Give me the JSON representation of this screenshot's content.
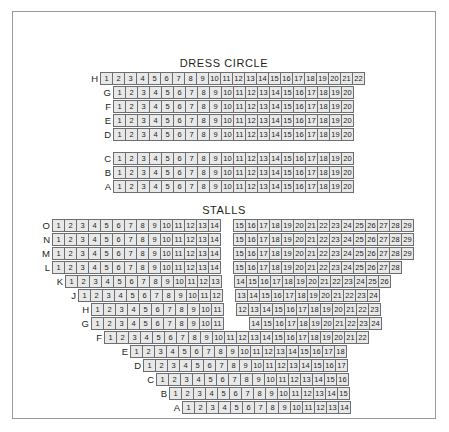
{
  "plan": {
    "sections": [
      {
        "name": "dress-circle",
        "title": "DRESS CIRCLE",
        "groups": [
          {
            "rows": [
              {
                "label": "H",
                "indent": 0,
                "blocks": [
                  {
                    "from": 1,
                    "to": 22
                  }
                ]
              },
              {
                "label": "G",
                "indent": 13,
                "blocks": [
                  {
                    "from": 1,
                    "to": 20
                  }
                ]
              },
              {
                "label": "F",
                "indent": 13,
                "blocks": [
                  {
                    "from": 1,
                    "to": 20
                  }
                ]
              },
              {
                "label": "E",
                "indent": 13,
                "blocks": [
                  {
                    "from": 1,
                    "to": 20
                  }
                ]
              },
              {
                "label": "D",
                "indent": 13,
                "blocks": [
                  {
                    "from": 1,
                    "to": 20
                  }
                ]
              }
            ]
          },
          {
            "rows": [
              {
                "label": "C",
                "indent": 13,
                "blocks": [
                  {
                    "from": 1,
                    "to": 20
                  }
                ]
              },
              {
                "label": "B",
                "indent": 13,
                "blocks": [
                  {
                    "from": 1,
                    "to": 20
                  }
                ]
              },
              {
                "label": "A",
                "indent": 13,
                "blocks": [
                  {
                    "from": 1,
                    "to": 20
                  }
                ]
              }
            ]
          }
        ]
      },
      {
        "name": "stalls",
        "title": "STALLS",
        "groups": [
          {
            "rows": [
              {
                "label": "O",
                "indent": 0,
                "blocks": [
                  {
                    "from": 1,
                    "to": 14
                  },
                  {
                    "gap": 13,
                    "from": 15,
                    "to": 29
                  }
                ]
              },
              {
                "label": "N",
                "indent": 0,
                "blocks": [
                  {
                    "from": 1,
                    "to": 14
                  },
                  {
                    "gap": 13,
                    "from": 15,
                    "to": 29
                  }
                ]
              },
              {
                "label": "M",
                "indent": 0,
                "blocks": [
                  {
                    "from": 1,
                    "to": 14
                  },
                  {
                    "gap": 13,
                    "from": 15,
                    "to": 29
                  }
                ]
              },
              {
                "label": "L",
                "indent": 0,
                "blocks": [
                  {
                    "from": 1,
                    "to": 14
                  },
                  {
                    "gap": 13,
                    "from": 15,
                    "to": 28
                  }
                ]
              },
              {
                "label": "K",
                "indent": 13,
                "blocks": [
                  {
                    "from": 1,
                    "to": 13
                  },
                  {
                    "gap": 13,
                    "from": 14,
                    "to": 26
                  }
                ]
              },
              {
                "label": "J",
                "indent": 26,
                "blocks": [
                  {
                    "from": 1,
                    "to": 12
                  },
                  {
                    "gap": 13,
                    "from": 13,
                    "to": 24
                  }
                ]
              },
              {
                "label": "H",
                "indent": 39,
                "blocks": [
                  {
                    "from": 1,
                    "to": 11
                  },
                  {
                    "gap": 13,
                    "from": 12,
                    "to": 23
                  }
                ]
              },
              {
                "label": "G",
                "indent": 39,
                "blocks": [
                  {
                    "from": 1,
                    "to": 11
                  },
                  {
                    "gap": 26,
                    "from": 14,
                    "to": 24
                  }
                ]
              },
              {
                "label": "F",
                "indent": 52,
                "blocks": [
                  {
                    "from": 1,
                    "to": 22
                  }
                ]
              },
              {
                "label": "E",
                "indent": 78,
                "blocks": [
                  {
                    "from": 1,
                    "to": 18
                  }
                ]
              },
              {
                "label": "D",
                "indent": 91,
                "blocks": [
                  {
                    "from": 1,
                    "to": 17
                  }
                ]
              },
              {
                "label": "C",
                "indent": 104,
                "blocks": [
                  {
                    "from": 1,
                    "to": 16
                  }
                ]
              },
              {
                "label": "B",
                "indent": 117,
                "blocks": [
                  {
                    "from": 1,
                    "to": 15
                  }
                ]
              },
              {
                "label": "A",
                "indent": 130,
                "blocks": [
                  {
                    "from": 1,
                    "to": 14
                  }
                ]
              }
            ]
          }
        ]
      }
    ]
  },
  "colors": {
    "seat_fill": "#e8e8e8",
    "seat_border": "#6d6e71",
    "text": "#231f20",
    "frame_border": "#9a9a9a"
  }
}
